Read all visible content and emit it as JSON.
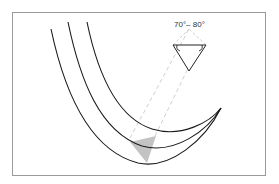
{
  "figure": {
    "angle_label": "70°– 80°",
    "colors": {
      "frame": "#9a9a9a",
      "curve": "#1a1a1a",
      "dashed": "#c8c8c8",
      "shaded_tip": "#b8b8b8",
      "triangle": "#222222"
    },
    "elements": [
      "three concentric curved cutting-edge lines",
      "detail triangle with angle arcs",
      "dashed projection lines",
      "shaded triangular section"
    ]
  }
}
